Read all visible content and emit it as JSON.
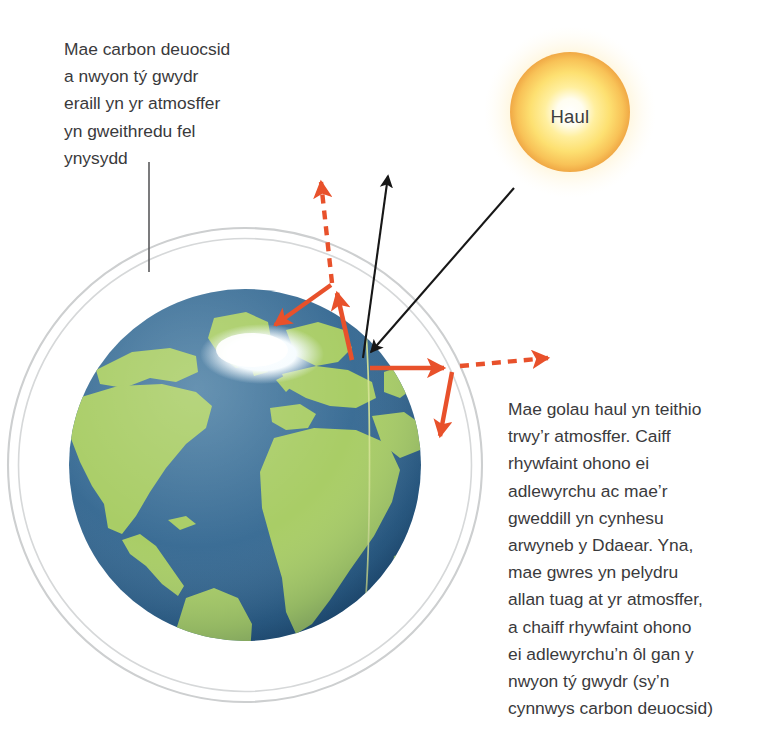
{
  "figure": {
    "language": "cy",
    "background_color": "#ffffff"
  },
  "sun": {
    "label": "Haul",
    "center": [
      570,
      112
    ],
    "radius": 60,
    "glow_radius": 86,
    "core_color": "#ffffff",
    "mid_color": "#ffe87a",
    "edge_color": "#f2ad4b",
    "label_color": "#3d3d3f"
  },
  "earth": {
    "name": "earth-globe",
    "center": [
      245,
      465
    ],
    "radius": 176,
    "ocean_color": "#3c6e96",
    "ocean_shadow_color": "#1e4a74",
    "land_color": "#a9cd66",
    "ice_color": "#f4fbff",
    "meridian_color": "#cfe08a"
  },
  "atmosphere": {
    "name": "atmosphere-ring",
    "center": [
      245,
      465
    ],
    "outer_radius": 232,
    "inner_radius": 221,
    "band_color": "#ffffff",
    "stroke_color": "#c9cbcc"
  },
  "captions": {
    "left": {
      "text": "Mae carbon deuocsid\na nwyon tý gwydr\neraill yn yr atmosffer\nyn gweithredu fel\nynysydd",
      "color": "#3a3a3c"
    },
    "right": {
      "text": "Mae golau haul yn teithio\ntrwy’r atmosffer. Caiff\nrhywfaint ohono ei\nadlewyrchu ac mae’r\ngweddill yn cynhesu\narwyneb y Ddaear. Yna,\nmae gwres yn pelydru\nallan tuag at yr atmosffer,\na chaiff rhywfaint ohono\nei adlewyrchu’n ôl gan y\nnwyon tý gwydr (sy’n\ncynnwys carbon deuocsid)",
      "color": "#3a3a3c"
    }
  },
  "leader_line": {
    "name": "caption-left-leader-line",
    "from": [
      149,
      162
    ],
    "to": [
      149,
      272
    ],
    "color": "#5a5a5c",
    "width": 1.6
  },
  "colors": {
    "solar_ray": "#171717",
    "heat_ray": "#e8512b",
    "text": "#3a3a3c",
    "atmosphere_gray": "#c9cbcc"
  },
  "rays": [
    {
      "name": "incoming-solar-ray",
      "type": "solar",
      "style": "solid",
      "color": "#171717",
      "from": [
        514,
        188
      ],
      "to": [
        365,
        357
      ],
      "arrowhead": "end",
      "meaning": "Golau haul yn teithio i mewn trwy’r atmosffer"
    },
    {
      "name": "reflected-solar-ray",
      "type": "solar",
      "style": "solid",
      "color": "#171717",
      "from": [
        363,
        358
      ],
      "to": [
        388,
        170
      ],
      "arrowhead": "end",
      "meaning": "Golau haul yn cael ei adlewyrchu allan i’r gofod"
    },
    {
      "name": "surface-heat-ray-up",
      "type": "heat",
      "style": "solid",
      "color": "#e8512b",
      "from": [
        352,
        360
      ],
      "to": [
        336,
        288
      ],
      "arrowhead": "end",
      "meaning": "Gwres yn pelydru allan o arwyneb y Ddaear"
    },
    {
      "name": "escaping-heat-ray-up",
      "type": "heat",
      "style": "dashed",
      "color": "#e8512b",
      "from": [
        332,
        283
      ],
      "to": [
        320,
        171
      ],
      "arrowhead": "end",
      "meaning": "Rhywfaint o’r gwres yn dianc i’r gofod"
    },
    {
      "name": "reflected-heat-ray-down-left",
      "type": "heat",
      "style": "solid",
      "color": "#e8512b",
      "from": [
        330,
        284
      ],
      "to": [
        268,
        329
      ],
      "arrowhead": "end",
      "meaning": "Gwres yn cael ei adlewyrchu’n ôl gan y nwyon tŷ gwydr"
    },
    {
      "name": "surface-heat-ray-right",
      "type": "heat",
      "style": "solid",
      "color": "#e8512b",
      "from": [
        370,
        368
      ],
      "to": [
        450,
        368
      ],
      "arrowhead": "end",
      "meaning": "Gwres yn pelydru allan tuag at yr atmosffer"
    },
    {
      "name": "escaping-heat-ray-right",
      "type": "heat",
      "style": "dashed",
      "color": "#e8512b",
      "from": [
        458,
        366
      ],
      "to": [
        556,
        357
      ],
      "arrowhead": "end",
      "meaning": "Rhywfaint o’r gwres yn dianc i’r gofod"
    },
    {
      "name": "reflected-heat-ray-down-right",
      "type": "heat",
      "style": "solid",
      "color": "#e8512b",
      "from": [
        452,
        372
      ],
      "to": [
        437,
        444
      ],
      "arrowhead": "end",
      "meaning": "Gwres yn cael ei adlewyrchu’n ôl tuag at y Ddaear"
    }
  ]
}
